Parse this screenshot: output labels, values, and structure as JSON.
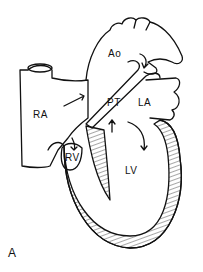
{
  "diagram": {
    "type": "anatomical heart cross-section",
    "labels": {
      "ao": "Ao",
      "pt": "PT",
      "ra": "RA",
      "la": "LA",
      "rv": "RV",
      "lv": "LV"
    },
    "panel_label": "A",
    "colors": {
      "line": "#111111",
      "background": "#ffffff"
    }
  }
}
